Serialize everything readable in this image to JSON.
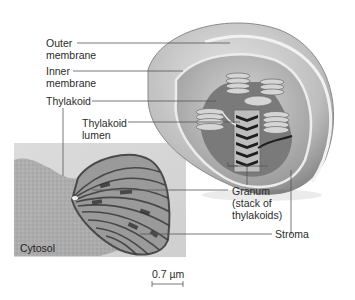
{
  "diagram": {
    "labels": {
      "outer_membrane": "Outer\nmembrane",
      "inner_membrane": "Inner\nmembrane",
      "thylakoid": "Thylakoid",
      "thylakoid_lumen": "Thylakoid\nlumen",
      "granum": "Granum\n(stack of\nthylakoids)",
      "stroma": "Stroma",
      "cytosol": "Cytosol"
    },
    "scale_bar": {
      "label": "0.7 µm"
    },
    "panels": [
      {
        "type": "illustration",
        "description": "3D cutaway chloroplast drawing"
      },
      {
        "type": "micrograph",
        "description": "TEM micrograph of chloroplast"
      }
    ],
    "colors": {
      "leader_line": "#555555",
      "text": "#2b2b2b",
      "photo_bg": "#d8d8d8"
    }
  }
}
